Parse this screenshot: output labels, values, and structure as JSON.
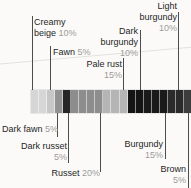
{
  "chart_data": {
    "type": "bar",
    "subtype": "horizontal stacked percentage color-swatch bar with callout labels",
    "categories": [
      "Creamy beige",
      "Fawn",
      "Dark fawn",
      "Dark russet",
      "Russet",
      "Pale rust",
      "Dark burgundy",
      "Burgundy",
      "Light burgundy",
      "Brown"
    ],
    "values": [
      10,
      5,
      5,
      5,
      20,
      15,
      10,
      15,
      10,
      5
    ],
    "unit": "%",
    "segment_unit_pct": 5,
    "colors": [
      "#d6d6d6",
      "#c7c7c7",
      "#929292",
      "#262626",
      "#8d8d8d",
      "#b5b5b5",
      "#141414",
      "#1a1a1a",
      "#2b2b2b",
      "#3d3d3d"
    ],
    "title": "",
    "xlabel": "",
    "ylabel": "",
    "legend_position": "callout labels above and below the bar",
    "grid": false
  },
  "labels": {
    "creamy_beige": {
      "line1": "Creamy",
      "line2": "beige",
      "pct": "10%"
    },
    "fawn": {
      "line1": "Fawn",
      "pct": "5%"
    },
    "pale_rust": {
      "line1": "Pale rust",
      "pct": "15%"
    },
    "dark_burgundy": {
      "line1": "Dark",
      "line2": "burgundy",
      "pct": "10%"
    },
    "light_burgundy": {
      "line1": "Light",
      "line2": "burgundy",
      "pct": "10%"
    },
    "dark_fawn": {
      "line1": "Dark fawn",
      "pct": "5%"
    },
    "dark_russet": {
      "line1": "Dark russet",
      "pct": "5%"
    },
    "russet": {
      "line1": "Russet",
      "pct": "20%"
    },
    "burgundy": {
      "line1": "Burgundy",
      "pct": "15%"
    },
    "brown": {
      "line1": "Brown",
      "pct": "5%"
    }
  },
  "style": {
    "accent_line_color": "#4d4d4d",
    "name_text_color": "#1f1f1f",
    "pct_text_color": "#9b9b9b",
    "background": "#fbfaf8"
  }
}
